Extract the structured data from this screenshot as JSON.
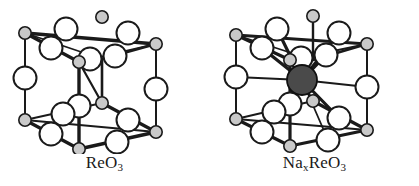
{
  "figure": {
    "kind": "crystal-structure-diagram",
    "background_color": "#ffffff",
    "panel_count": 2
  },
  "panels": [
    {
      "id": "reo3",
      "caption_formula": "ReO3",
      "caption_parts": {
        "main1": "ReO",
        "sub1": "3"
      },
      "description": "ReO3 cubic unit cell: rhenium at cube corners, oxygen at edge midpoints",
      "has_center_atom": false
    },
    {
      "id": "naxreo3",
      "caption_formula": "NaxReO3",
      "caption_parts": {
        "main1": "Na",
        "sub1": "x",
        "main2": "ReO",
        "sub2": "3"
      },
      "description": "Sodium tungsten-bronze type NaxReO3 cell: same ReO3 framework with a sodium atom inserted at the body centre, bonded to the twelve surrounding oxygen atoms",
      "has_center_atom": true
    }
  ],
  "atoms": {
    "rhenium": {
      "label": "Re",
      "role": "cube-corner",
      "count_per_cell": 8,
      "radius_px": 6,
      "fill_color": "#c8c8c8",
      "stroke_color": "#1a1a1a"
    },
    "oxygen": {
      "label": "O",
      "role": "edge-midpoint",
      "count_per_cell": 12,
      "radius_px": 11,
      "fill_color": "#ffffff",
      "stroke_color": "#1a1a1a"
    },
    "sodium": {
      "label": "Na",
      "role": "body-centre",
      "count_per_cell": 1,
      "radius_px": 15,
      "fill_color": "#4a4a4a",
      "stroke_color": "#101010"
    }
  },
  "bonds": {
    "frame_color": "#1a1a1a",
    "frame_width_px": 3,
    "thin_width_px": 1.6,
    "sodium_bond_color": "#1a1a1a",
    "sodium_bond_width_px": 3
  },
  "geometry": {
    "projection": "oblique",
    "corners_left": {
      "back_top_left": [
        24,
        31
      ],
      "back_top_right": [
        155,
        42
      ],
      "back_bottom_left": [
        24,
        118
      ],
      "back_bottom_right": [
        155,
        130
      ],
      "front_top_left": [
        78,
        59
      ],
      "front_top_right": [
        101,
        100
      ],
      "front_bottom_left": [
        78,
        146
      ],
      "front_bottom_right": [
        101,
        100
      ]
    }
  }
}
